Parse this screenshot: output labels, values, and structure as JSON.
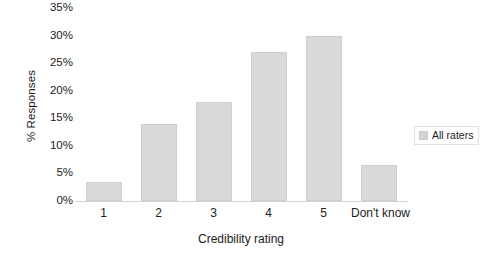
{
  "chart_data": {
    "type": "bar",
    "title": "",
    "categories": [
      "1",
      "2",
      "3",
      "4",
      "5",
      "Don't know"
    ],
    "values": [
      3.5,
      14,
      18,
      27,
      30,
      6.5
    ],
    "series": [
      {
        "name": "All raters",
        "values": [
          3.5,
          14,
          18,
          27,
          30,
          6.5
        ]
      }
    ],
    "xlabel": "Credibility rating",
    "ylabel": "% Responses",
    "ylim": [
      0,
      35
    ],
    "ytick_labels": [
      "35%",
      "30%",
      "25%",
      "20%",
      "15%",
      "10%",
      "5%",
      "0%"
    ],
    "ytick_values": [
      35,
      30,
      25,
      20,
      15,
      10,
      5,
      0
    ],
    "grid": false,
    "legend_position": "right",
    "bar_color": "#d9d9d9",
    "bar_border_color": "#cfcfcf",
    "axis_color": "#d2d2d2",
    "text_color": "#1c1c1c",
    "background": "#ffffff"
  },
  "legend": {
    "entries": [
      {
        "label": "All raters",
        "color": "#d4d4d4"
      }
    ]
  }
}
